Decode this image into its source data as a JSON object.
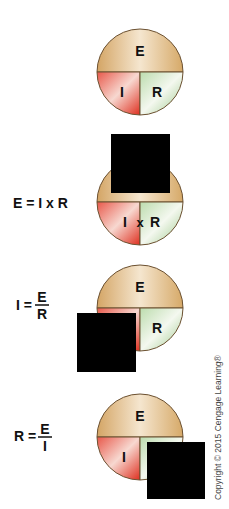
{
  "diagrams": [
    {
      "id": "ohms-law-circle",
      "formula": null,
      "top_label": "E",
      "left_label": "I",
      "right_label": "R",
      "operator": null,
      "covered": "none"
    },
    {
      "id": "find-voltage",
      "formula": {
        "lhs": "E = I x R"
      },
      "top_label": "E",
      "left_label": "I",
      "right_label": "R",
      "operator": "x",
      "covered": "top"
    },
    {
      "id": "find-current",
      "formula": {
        "lhs": "I =",
        "numerator": "E",
        "denominator": "R"
      },
      "top_label": "E",
      "left_label": "I",
      "right_label": "R",
      "operator": null,
      "covered": "left"
    },
    {
      "id": "find-resistance",
      "formula": {
        "lhs": "R =",
        "numerator": "E",
        "denominator": "I"
      },
      "top_label": "E",
      "left_label": "I",
      "right_label": "R",
      "operator": null,
      "covered": "right"
    }
  ],
  "colors": {
    "top_segment": "#d9b27a",
    "left_segment": "#e0402c",
    "right_segment": "#a9cf9a",
    "cover": "#000000",
    "outline": "#6b5030"
  },
  "copyright": "Copyright © 2015 Cengage Learning®"
}
